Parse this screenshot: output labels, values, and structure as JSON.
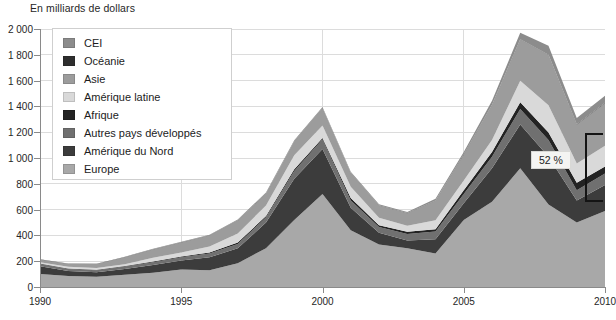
{
  "chart_data": {
    "type": "area",
    "title": "En milliards de dollars",
    "xlabel": "",
    "ylabel": "En milliards de dollars",
    "xlim": [
      1990,
      2010
    ],
    "ylim": [
      0,
      2000
    ],
    "grid": true,
    "stacked": true,
    "legend_position": "top-left",
    "x": [
      1990,
      1991,
      1992,
      1993,
      1994,
      1995,
      1996,
      1997,
      1998,
      1999,
      2000,
      2001,
      2002,
      2003,
      2004,
      2005,
      2006,
      2007,
      2008,
      2009,
      2010
    ],
    "xticks": [
      1990,
      1995,
      2000,
      2005,
      2010
    ],
    "xticklabels": [
      "1990",
      "1995",
      "2000",
      "2005",
      "2010"
    ],
    "yticks": [
      0,
      200,
      400,
      600,
      800,
      1000,
      1200,
      1400,
      1600,
      1800,
      2000
    ],
    "yticklabels": [
      "0",
      "200",
      "400",
      "600",
      "800",
      "1 000",
      "1 200",
      "1 400",
      "1 600",
      "1 800",
      "2 000"
    ],
    "series": [
      {
        "name": "Europe",
        "color": "#a8a8a8",
        "values": [
          100,
          85,
          80,
          95,
          110,
          135,
          130,
          185,
          300,
          520,
          720,
          440,
          330,
          300,
          260,
          520,
          660,
          920,
          640,
          500,
          590
        ]
      },
      {
        "name": "Amérique du Nord",
        "color": "#3c3c3c",
        "values": [
          60,
          40,
          35,
          45,
          60,
          70,
          100,
          115,
          200,
          320,
          350,
          175,
          90,
          60,
          110,
          130,
          260,
          340,
          370,
          170,
          200
        ]
      },
      {
        "name": "Autres pays développés",
        "color": "#707070",
        "values": [
          18,
          15,
          14,
          18,
          22,
          26,
          30,
          34,
          40,
          60,
          75,
          55,
          45,
          50,
          60,
          70,
          90,
          120,
          130,
          80,
          90
        ]
      },
      {
        "name": "Afrique",
        "color": "#232323",
        "values": [
          4,
          4,
          4,
          5,
          6,
          6,
          7,
          11,
          10,
          13,
          10,
          20,
          14,
          18,
          18,
          30,
          36,
          52,
          58,
          58,
          55
        ]
      },
      {
        "name": "Amérique latine",
        "color": "#d9d9d9",
        "values": [
          9,
          13,
          15,
          13,
          28,
          31,
          46,
          70,
          82,
          108,
          97,
          88,
          58,
          46,
          70,
          76,
          94,
          166,
          210,
          150,
          160
        ]
      },
      {
        "name": "Asie",
        "color": "#9c9c9c",
        "values": [
          22,
          22,
          30,
          55,
          65,
          77,
          86,
          100,
          91,
          106,
          136,
          106,
          94,
          97,
          150,
          200,
          270,
          320,
          390,
          300,
          330
        ]
      },
      {
        "name": "Océanie",
        "color": "#2e2e2e",
        "values": [
          2,
          2,
          2,
          2,
          2,
          2,
          2,
          2,
          2,
          2,
          2,
          2,
          2,
          2,
          2,
          3,
          3,
          3,
          3,
          3,
          3
        ]
      },
      {
        "name": "CEI",
        "color": "#8c8c8c",
        "values": [
          0,
          1,
          1,
          2,
          3,
          4,
          5,
          6,
          7,
          8,
          5,
          7,
          8,
          9,
          14,
          18,
          30,
          50,
          70,
          50,
          55
        ]
      }
    ],
    "annotations": [
      {
        "label": "52 %",
        "kind": "bracket-callout",
        "x": 2010,
        "y_top": 1190,
        "y_bottom": 655
      }
    ]
  },
  "legend": {
    "items": [
      {
        "label": "CEI",
        "color": "#8c8c8c"
      },
      {
        "label": "Océanie",
        "color": "#2e2e2e"
      },
      {
        "label": "Asie",
        "color": "#9c9c9c"
      },
      {
        "label": "Amérique latine",
        "color": "#d9d9d9"
      },
      {
        "label": "Afrique",
        "color": "#232323"
      },
      {
        "label": "Autres pays développés",
        "color": "#707070"
      },
      {
        "label": "Amérique du Nord",
        "color": "#3c3c3c"
      },
      {
        "label": "Europe",
        "color": "#a8a8a8"
      }
    ]
  },
  "colors": {
    "axis": "#8a8a8a",
    "grid": "#dcdcdc",
    "text": "#262626",
    "annotation": "#141414",
    "background": "#ffffff"
  }
}
